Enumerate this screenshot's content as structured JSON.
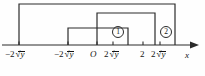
{
  "figure": {
    "type": "number-line-diagram",
    "title": "",
    "axis": {
      "name": "x",
      "line_y": 45,
      "arrow": "right",
      "origin_label": "O"
    },
    "tick_labels": [
      {
        "id": "t1",
        "prefix": "−2",
        "radical": "y",
        "x": 8,
        "y": 50,
        "tick_x": 19
      },
      {
        "id": "t2",
        "prefix": "−2",
        "radical": "y",
        "x": 57,
        "y": 50,
        "tick_x": 68
      },
      {
        "id": "t3",
        "prefix": "O",
        "radical": "",
        "x": 91,
        "y": 50,
        "tick_x": 97
      },
      {
        "id": "t4",
        "prefix": "2",
        "radical": "y",
        "x": 106,
        "y": 50,
        "tick_x": 113
      },
      {
        "id": "t5",
        "prefix": "2",
        "radical": "",
        "x": 140,
        "y": 50,
        "tick_x": 143
      },
      {
        "id": "t6",
        "prefix": "2",
        "radical": "y",
        "x": 153,
        "y": 50,
        "tick_x": 160
      }
    ],
    "tick_texts": {
      "minus_two_root_y": "−2√y",
      "origin": "O",
      "two_root_y": "2√y",
      "two": "2",
      "x_axis": "x"
    },
    "regions": [
      {
        "id": "r1",
        "label": "①",
        "label_x": 117,
        "label_y": 31
      },
      {
        "id": "r2",
        "label": "②",
        "label_x": 163,
        "label_y": 31
      }
    ],
    "rectangles": [
      {
        "name": "outer-rect",
        "x1": 19,
        "y1": 4,
        "x2": 175,
        "y2": 45
      },
      {
        "name": "middle-rect",
        "x1": 97,
        "y1": 13,
        "x2": 155,
        "y2": 45
      },
      {
        "name": "inner-rect",
        "x1": 68,
        "y1": 28,
        "x2": 128,
        "y2": 45
      }
    ],
    "colors": {
      "stroke": "#2b2b2b",
      "axis": "#2b2b2b",
      "text": "#141414",
      "background": "#fefefe"
    },
    "radical_symbol": "√"
  }
}
